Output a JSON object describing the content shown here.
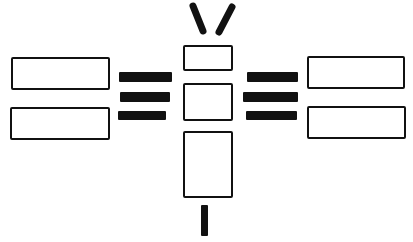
{
  "diagram": {
    "type": "schematic-line-drawing",
    "colors": {
      "stroke": "#111111",
      "background": "#ffffff"
    },
    "antennas": [
      {
        "id": "antenna-left",
        "x1": 193,
        "y1": 6,
        "x2": 203,
        "y2": 31
      },
      {
        "id": "antenna-right",
        "x1": 232,
        "y1": 7,
        "x2": 219,
        "y2": 32
      }
    ],
    "center_column": [
      {
        "id": "center-top-box",
        "x": 183,
        "y": 45,
        "w": 50,
        "h": 26
      },
      {
        "id": "center-middle-box",
        "x": 183,
        "y": 83,
        "w": 50,
        "h": 38
      },
      {
        "id": "center-bottom-box",
        "x": 183,
        "y": 131,
        "w": 50,
        "h": 67
      }
    ],
    "stem": {
      "id": "bottom-stem",
      "x": 201,
      "y": 205,
      "w": 7,
      "h": 31
    },
    "left_panels": [
      {
        "id": "left-top-panel",
        "x": 11,
        "y": 57,
        "w": 99,
        "h": 33
      },
      {
        "id": "left-bottom-panel",
        "x": 10,
        "y": 107,
        "w": 100,
        "h": 33
      }
    ],
    "left_bars": [
      {
        "x": 119,
        "y": 72,
        "w": 53,
        "h": 10
      },
      {
        "x": 120,
        "y": 92,
        "w": 50,
        "h": 10
      },
      {
        "x": 118,
        "y": 111,
        "w": 48,
        "h": 9
      }
    ],
    "right_bars": [
      {
        "x": 247,
        "y": 72,
        "w": 51,
        "h": 10
      },
      {
        "x": 243,
        "y": 92,
        "w": 55,
        "h": 10
      },
      {
        "x": 246,
        "y": 111,
        "w": 51,
        "h": 9
      }
    ],
    "right_panels": [
      {
        "id": "right-top-panel",
        "x": 307,
        "y": 56,
        "w": 98,
        "h": 33
      },
      {
        "id": "right-bottom-panel",
        "x": 307,
        "y": 106,
        "w": 99,
        "h": 33
      }
    ]
  }
}
